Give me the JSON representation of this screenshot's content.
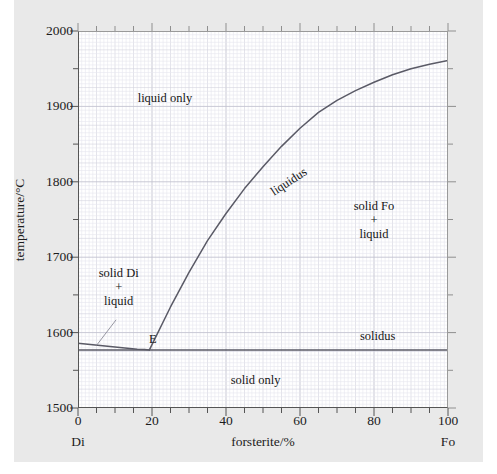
{
  "figure": {
    "background": "#e9e9e9",
    "plot_background": "#ffffff",
    "curve_color": "#5a5a66",
    "grid_color": "#d9d9e2"
  },
  "chart_data": {
    "type": "line",
    "title": "",
    "subtitle": "",
    "xlabel": "forsterite/%",
    "ylabel": "temperature/°C",
    "xlim": [
      0,
      100
    ],
    "ylim": [
      1500,
      2000
    ],
    "xticks": [
      0,
      20,
      40,
      60,
      80,
      100
    ],
    "xticklabels": [
      "0",
      "20",
      "40",
      "60",
      "80",
      "100"
    ],
    "xminor_step": 5,
    "yticks": [
      1500,
      1600,
      1700,
      1800,
      1900,
      2000
    ],
    "yticklabels": [
      "1500",
      "1600",
      "1700",
      "1800",
      "1900",
      "2000"
    ],
    "yminor_step": 50,
    "grid": true,
    "grid_style": "fine graph paper, minor 1% / 5°C",
    "legend": "none",
    "axis_end_labels": {
      "left": "Di",
      "right": "Fo"
    },
    "series": [
      {
        "name": "liquidus",
        "label": "liquidus",
        "color": "#5a5a66",
        "points": [
          [
            0,
            1586
          ],
          [
            2,
            1585
          ],
          [
            4,
            1584
          ],
          [
            6,
            1583
          ],
          [
            8,
            1582
          ],
          [
            10,
            1581
          ],
          [
            12,
            1580
          ],
          [
            14,
            1579
          ],
          [
            16,
            1578
          ],
          [
            18,
            1577.5
          ],
          [
            19.3,
            1577
          ]
        ]
      },
      {
        "name": "liquidus-fo",
        "label": "liquidus",
        "color": "#5a5a66",
        "points": [
          [
            19.3,
            1577
          ],
          [
            25,
            1634
          ],
          [
            30,
            1680
          ],
          [
            35,
            1722
          ],
          [
            40,
            1758
          ],
          [
            45,
            1791
          ],
          [
            50,
            1820
          ],
          [
            55,
            1847
          ],
          [
            60,
            1871
          ],
          [
            65,
            1892
          ],
          [
            70,
            1908
          ],
          [
            75,
            1921
          ],
          [
            80,
            1932
          ],
          [
            85,
            1942
          ],
          [
            90,
            1950
          ],
          [
            95,
            1956
          ],
          [
            100,
            1961
          ]
        ]
      },
      {
        "name": "solidus",
        "label": "solidus",
        "color": "#5a5a66",
        "points": [
          [
            0,
            1577
          ],
          [
            100,
            1577
          ]
        ]
      }
    ],
    "annotations": [
      {
        "name": "eutectic-point",
        "text": "E",
        "x": 20.2,
        "y": 1592
      },
      {
        "name": "liquidus-label",
        "text": "liquidus",
        "x": 57,
        "y": 1800,
        "rotation": -33
      },
      {
        "name": "solidus-label",
        "text": "solidus",
        "x": 81,
        "y": 1595
      },
      {
        "name": "region-liquid-only",
        "text": "liquid only",
        "x": 23.5,
        "y": 1911
      },
      {
        "name": "region-solid-di-liquid",
        "text": "solid Di\n+\nliquid",
        "x": 11,
        "y": 1660
      },
      {
        "name": "region-solid-fo-liquid",
        "text": "solid Fo\n+\nliquid",
        "x": 80,
        "y": 1750
      },
      {
        "name": "region-solid-only",
        "text": "solid only",
        "x": 48,
        "y": 1537
      }
    ],
    "leader_line": {
      "name": "liquid-leader",
      "from": [
        10.3,
        1617
      ],
      "to": [
        5.0,
        1583
      ]
    }
  },
  "labels": {
    "y_axis_title": "temperature/°C",
    "x_axis_title": "forsterite/%",
    "left_end": "Di",
    "right_end": "Fo",
    "liquid_only": "liquid only",
    "solid_only": "solid only",
    "solid_di": "solid Di",
    "plus": "+",
    "liquid": "liquid",
    "solid_fo": "solid Fo",
    "liquidus": "liquidus",
    "solidus": "solidus",
    "eutectic": "E"
  }
}
